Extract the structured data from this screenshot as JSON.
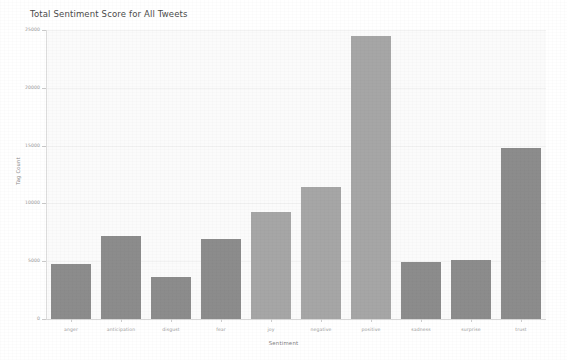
{
  "figure": {
    "background_color": "#ffffff",
    "plot_background_color": "#fbfbfb",
    "bar_color": "#8c8c8c",
    "bar_color_light": "#a6a6a6",
    "axis_color": "#d8d8d8",
    "grid_color": "#f0f0f0",
    "tick_text_color": "#9a9a9a"
  },
  "chart_data": {
    "type": "bar",
    "title": "Total Sentiment Score for All Tweets",
    "xlabel": "Sentiment",
    "ylabel": "Tag Count",
    "categories": [
      "anger",
      "anticipation",
      "disgust",
      "fear",
      "joy",
      "negative",
      "positive",
      "sadness",
      "surprise",
      "trust"
    ],
    "values": [
      4800,
      7200,
      3600,
      6900,
      9300,
      11400,
      24500,
      4900,
      5100,
      14800
    ],
    "ylim": [
      0,
      25000
    ],
    "ytick_values": [
      0,
      5000,
      10000,
      15000,
      20000,
      25000
    ],
    "ytick_labels": [
      "0",
      "5000",
      "10000",
      "15000",
      "20000",
      "25000"
    ],
    "grid": true,
    "legend": false,
    "legend_position": "none",
    "orientation": "vertical",
    "bar_shades": [
      "dark",
      "dark",
      "dark",
      "dark",
      "light",
      "light",
      "light",
      "dark",
      "dark",
      "dark"
    ]
  }
}
